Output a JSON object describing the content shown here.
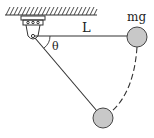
{
  "diagram": {
    "labels": {
      "length": "L",
      "weight": "mg",
      "angle": "θ"
    },
    "colors": {
      "line": "#333333",
      "ball_fill": "#c8c8c8",
      "ball_stroke": "#444444"
    }
  }
}
